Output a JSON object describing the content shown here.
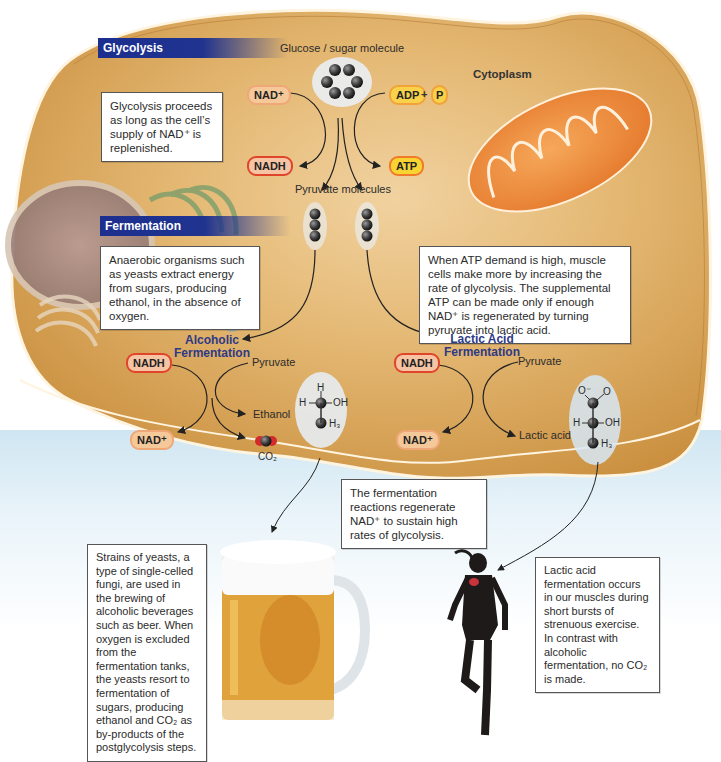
{
  "sections": {
    "glycolysis": "Glycolysis",
    "fermentation": "Fermentation"
  },
  "region_label": "Cytoplasm",
  "glycolysis": {
    "glucose_label": "Glucose / sugar molecule",
    "nad_plus": "NAD⁺",
    "nadh": "NADH",
    "adp": "ADP",
    "plus": "+",
    "p": "P",
    "atp": "ATP",
    "pyruvate_label": "Pyruvate molecules",
    "callout": "Glycolysis proceeds as long as the cell’s supply of NAD⁺ is replenished."
  },
  "alcoholic": {
    "title_line1": "Alcoholic",
    "title_line2": "Fermentation",
    "nadh": "NADH",
    "nad_plus": "NAD⁺",
    "pyruvate": "Pyruvate",
    "ethanol": "Ethanol",
    "co2": "CO₂",
    "callout": "Anaerobic organisms such as yeasts extract energy from sugars, producing ethanol, in the absence of oxygen.",
    "molecule": {
      "top": "H",
      "left": "H",
      "right": "OH",
      "bottom": "H₃"
    }
  },
  "lactic": {
    "title_line1": "Lactic Acid",
    "title_line2": "Fermentation",
    "nadh": "NADH",
    "nad_plus": "NAD⁺",
    "pyruvate": "Pyruvate",
    "lactic_acid": "Lactic acid",
    "callout": "When ATP demand is high, muscle cells make more by increasing the rate of glycolysis. The supplemental ATP can be made only if enough NAD⁺ is regenerated by turning pyruvate into lactic acid.",
    "molecule": {
      "o_minus": "O⁻",
      "o": "O",
      "left": "H",
      "right": "OH",
      "bottom": "H₃"
    }
  },
  "regen_callout": "The fermentation reactions regenerate NAD⁺ to sustain high rates of glycolysis.",
  "beer_callout": "Strains of yeasts, a type of single-celled fungi, are used in the brewing of alcoholic beverages such as beer. When oxygen is excluded from the fermentation tanks, the yeasts resort to fermentation of sugars, producing ethanol and CO₂ as by-products of the postglycolysis steps.",
  "runner_callout": "Lactic acid fermentation occurs in our muscles during short bursts of strenuous exercise. In contrast with alcoholic fermentation, no CO₂ is made.",
  "colors": {
    "cell_fill": "#d9a352",
    "section_bar": "#1f338f",
    "nadh_border": "#e0452b",
    "atp_fill": "#f7d432",
    "mitochondrion": "#ec8a3a"
  }
}
